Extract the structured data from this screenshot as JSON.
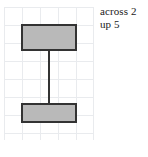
{
  "canvas": {
    "width": 148,
    "height": 157,
    "background": "#ffffff"
  },
  "grid": {
    "name": "square-grid",
    "line_color": "#e9ebee",
    "cell_size": 18,
    "columns": 5,
    "rows": 7,
    "origin_x": 4,
    "origin_y": 7,
    "width": 90,
    "height": 133
  },
  "shape": {
    "name": "i-beam-polygon",
    "label": "I",
    "fill_color": "#b9b9b9",
    "stroke_color": "#333333",
    "stroke_width": 2,
    "top_bar_cells_across": 3,
    "stem_cells_across": 1,
    "bottom_bar_cells_across": 3,
    "total_cells_up": 5,
    "points": "18,18 72,18 72,43 45,43 45,97 72,97 72,115 18,115 18,97 45,97 45,43 18,43"
  },
  "annotation": {
    "name": "measurement-note",
    "line1": "across 2",
    "line2": "up 5",
    "text_color": "#1a1a1a"
  }
}
